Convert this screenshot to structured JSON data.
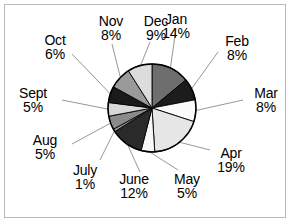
{
  "figure": {
    "background": "#ffffff",
    "frame_color": "#b9b9b9",
    "text_color": "#000000",
    "outline_color": "#000000",
    "leader_color": "#8a8a8a"
  },
  "chart_data": {
    "type": "pie",
    "title": "",
    "subtitle": "",
    "xlabel": "",
    "ylabel": "",
    "grid": false,
    "legend": "none",
    "label_format": "name + percent",
    "units": "percent",
    "total": 100,
    "start_angle_deg": 90,
    "direction": "clockwise",
    "categories": [
      "Jan",
      "Feb",
      "Mar",
      "Apr",
      "May",
      "June",
      "July",
      "Aug",
      "Sept",
      "Oct",
      "Nov",
      "Dec"
    ],
    "values": [
      14,
      8,
      8,
      19,
      5,
      12,
      1,
      5,
      5,
      6,
      8,
      9
    ],
    "slices": [
      {
        "label": "Jan",
        "percent": 14,
        "percent_text": "14%",
        "color": "#6e6e6e"
      },
      {
        "label": "Feb",
        "percent": 8,
        "percent_text": "8%",
        "color": "#1c1c1c"
      },
      {
        "label": "Mar",
        "percent": 8,
        "percent_text": "8%",
        "color": "#fbfbfb"
      },
      {
        "label": "Apr",
        "percent": 19,
        "percent_text": "19%",
        "color": "#e6e6e6"
      },
      {
        "label": "May",
        "percent": 5,
        "percent_text": "5%",
        "color": "#f7f7f7"
      },
      {
        "label": "June",
        "percent": 12,
        "percent_text": "12%",
        "color": "#2a2a2a"
      },
      {
        "label": "July",
        "percent": 1,
        "percent_text": "1%",
        "color": "#9c9c9c"
      },
      {
        "label": "Aug",
        "percent": 5,
        "percent_text": "5%",
        "color": "#8a8a8a"
      },
      {
        "label": "Sept",
        "percent": 5,
        "percent_text": "5%",
        "color": "#d8d8d8"
      },
      {
        "label": "Oct",
        "percent": 6,
        "percent_text": "6%",
        "color": "#1a1a1a"
      },
      {
        "label": "Nov",
        "percent": 8,
        "percent_text": "8%",
        "color": "#9a9a9a"
      },
      {
        "label": "Dec",
        "percent": 9,
        "percent_text": "9%",
        "color": "#dcdcdc"
      }
    ]
  },
  "labels": {
    "jan": {
      "name": "Jan",
      "pct": "14%"
    },
    "feb": {
      "name": "Feb",
      "pct": "8%"
    },
    "mar": {
      "name": "Mar",
      "pct": "8%"
    },
    "apr": {
      "name": "Apr",
      "pct": "19%"
    },
    "may": {
      "name": "May",
      "pct": "5%"
    },
    "june": {
      "name": "June",
      "pct": "12%"
    },
    "july": {
      "name": "July",
      "pct": "1%"
    },
    "aug": {
      "name": "Aug",
      "pct": "5%"
    },
    "sept": {
      "name": "Sept",
      "pct": "5%"
    },
    "oct": {
      "name": "Oct",
      "pct": "6%"
    },
    "nov": {
      "name": "Nov",
      "pct": "8%"
    },
    "dec": {
      "name": "Dec",
      "pct": "9%"
    }
  }
}
